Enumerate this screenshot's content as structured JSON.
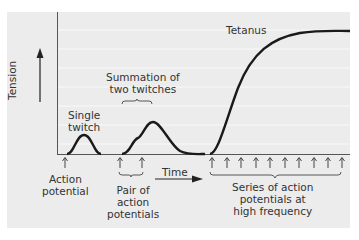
{
  "diagram": {
    "y_axis_label": "Tension",
    "x_axis_label": "Time",
    "curves": {
      "single_twitch": "Single\ntwitch",
      "summation": "Summation of\ntwo twitches",
      "tetanus": "Tetanus"
    },
    "stimuli": {
      "single": "Action\npotential",
      "pair": "Pair of\naction\npotentials",
      "series": "Series of action\npotentials at\nhigh frequency"
    },
    "series_arrow_count": 10
  },
  "colors": {
    "panel": "#ececec",
    "gridline": "#f8f8f8",
    "curve": "#1a1a1a",
    "text": "#333333"
  }
}
